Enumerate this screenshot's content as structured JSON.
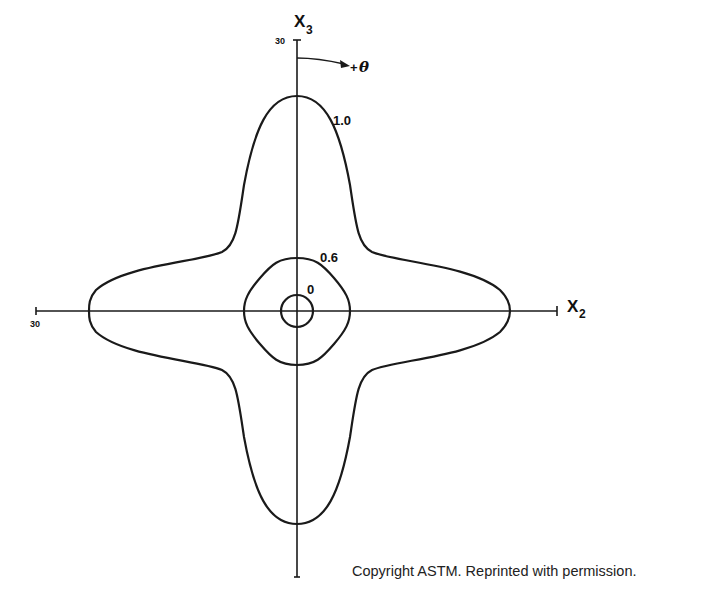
{
  "figure": {
    "axes": {
      "horizontal": {
        "label_main": "X",
        "label_sub": "2",
        "tick_label": "30"
      },
      "vertical": {
        "label_main": "X",
        "label_sub": "3",
        "tick_label": "30"
      }
    },
    "rotation": {
      "label_sign": "+",
      "label_symbol": "θ"
    },
    "contours": [
      {
        "label": "1.0"
      },
      {
        "label": "0.6"
      },
      {
        "label": "0"
      }
    ]
  },
  "caption": {
    "copyright": "Copyright ASTM. Reprinted with permission."
  }
}
